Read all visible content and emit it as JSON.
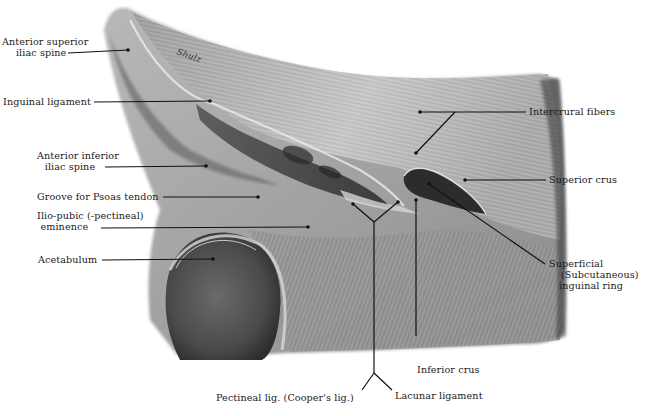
{
  "figure": {
    "signature": "Shulz",
    "colors": {
      "ink": "#1a1a1a",
      "tissue_light": "#d8d8d8",
      "tissue_mid": "#9a9a9a",
      "tissue_dark": "#3a3a3a",
      "background": "#ffffff"
    }
  },
  "labels": {
    "asis": {
      "line1": "Anterior superior",
      "line2": "iliac spine"
    },
    "inguinal_ligament": "Inguinal ligament",
    "aiis": {
      "line1": "Anterior inferior",
      "line2": "iliac spine"
    },
    "psoas_groove": "Groove for Psoas tendon",
    "iliopubic": {
      "line1": "Ilio-pubic (-pectineal)",
      "line2": "eminence"
    },
    "acetabulum": "Acetabulum",
    "intercrural": "Intercrural fibers",
    "superior_crus": "Superior crus",
    "superficial_ring": {
      "line1": "Superficial",
      "line2": "(Subcutaneous)",
      "line3": "inguinal ring"
    },
    "inferior_crus": "Inferior crus",
    "pectineal": "Pectineal lig. (Cooper's lig.)",
    "lacunar": "Lacunar ligament"
  }
}
